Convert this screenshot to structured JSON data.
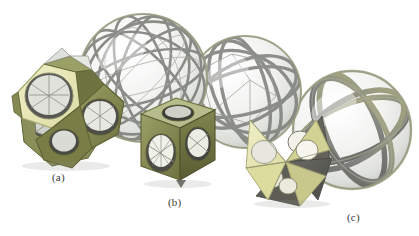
{
  "figure": {
    "background_color": "#ffffff",
    "width": 419,
    "height": 236,
    "caption_labels": [
      {
        "id": "a",
        "text": "(a)",
        "x": 52,
        "y": 171
      },
      {
        "id": "b",
        "text": "(b)",
        "x": 168,
        "y": 196
      },
      {
        "id": "c",
        "text": "(c)",
        "x": 347,
        "y": 211
      }
    ]
  },
  "palette": {
    "pale_yellow": "#e4e4ae",
    "light_yellow": "#eeeec0",
    "olive": "#7e8049",
    "olive_light": "#9aa066",
    "olive_dark": "#5f6235",
    "dark_gray": "#55554f",
    "mid_gray": "#8b8b86",
    "sphere_light": "#f4f5f3",
    "sphere_shadow": "#d7d9d5",
    "band_gray": "#7b7d78",
    "band_olive": "#9a9c6e",
    "edge_stroke": "#6e706a",
    "glass_fill": "#eef0ee",
    "shadow": "#d9dad7"
  },
  "objects": [
    {
      "name": "holey-dodecahedron",
      "panel": "a",
      "description": "Polyhedron with pentagonal faces pierced by circular holes",
      "face_color": "#e4e4ae",
      "rim_color": "#7e8049",
      "interior_color": "#55554f",
      "center_x": 62,
      "center_y": 112,
      "radius": 58
    },
    {
      "name": "dodecahedral-sphere",
      "panel": "a",
      "description": "Spherical projection of the dodecahedral cell pattern",
      "center_x": 143,
      "center_y": 78,
      "radius": 64
    },
    {
      "name": "holey-cube",
      "panel": "b",
      "description": "Cube with a circular hole through the centre of each face",
      "face_color": "#9aa066",
      "rim_color": "#7e8049",
      "interior_color": "#55554f",
      "center_x": 176,
      "center_y": 141,
      "radius": 42
    },
    {
      "name": "cubic-sphere",
      "panel": "b",
      "description": "Spherical projection of the cubic cell pattern",
      "center_x": 245,
      "center_y": 92,
      "radius": 56
    },
    {
      "name": "stellated-octahedron",
      "panel": "c",
      "description": "Stella octangula with circular holes in its triangular faces",
      "face_color": "#e4e4ae",
      "rim_color": "#9a9c6e",
      "interior_color": "#55554f",
      "center_x": 286,
      "center_y": 162,
      "radius": 48
    },
    {
      "name": "tetrahedral-sphere",
      "panel": "c",
      "description": "Spherical projection of the tetrahedral cell pattern",
      "center_x": 352,
      "center_y": 130,
      "radius": 59
    }
  ]
}
